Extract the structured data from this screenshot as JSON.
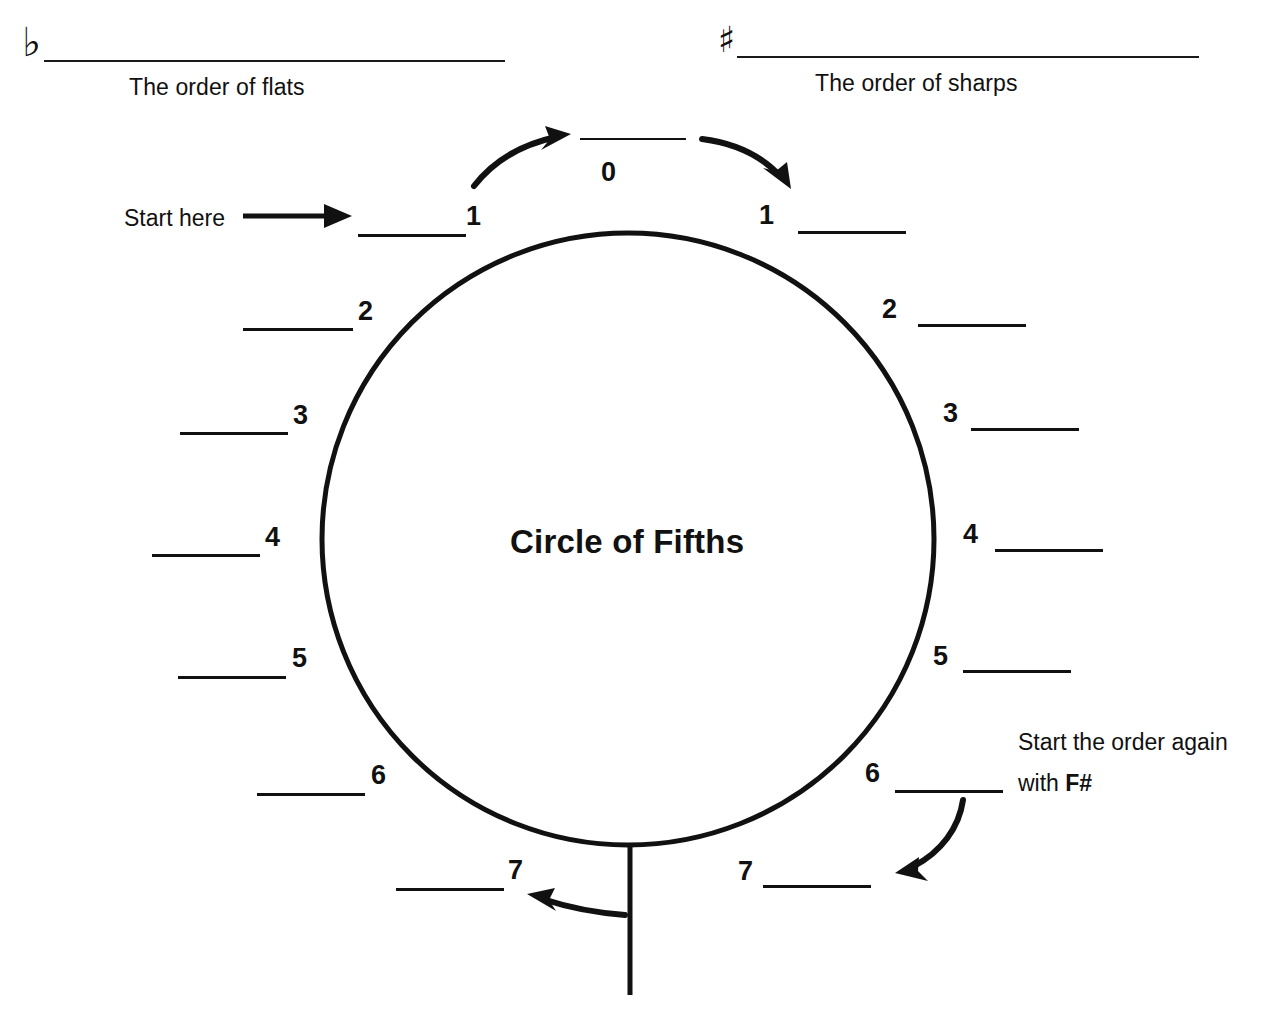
{
  "page": {
    "title": "Circle of Fifths",
    "background": "#ffffff",
    "ink_color": "#111111"
  },
  "header": {
    "flats": {
      "symbol": "♭",
      "symbol_name": "flat-sign",
      "caption": "The order of flats",
      "answer_value": ""
    },
    "sharps": {
      "symbol": "♯",
      "symbol_name": "sharp-sign",
      "caption": "The order of sharps",
      "answer_value": ""
    }
  },
  "circle": {
    "center_label": "Circle of Fifths"
  },
  "annotations": {
    "start_here": "Start here",
    "restart_line1": "Start the order again",
    "restart_line2_prefix": "with ",
    "restart_line2_bold": "F#"
  },
  "top_slot": {
    "number": "0",
    "value": ""
  },
  "flat_slots": [
    {
      "number": "1",
      "value": ""
    },
    {
      "number": "2",
      "value": ""
    },
    {
      "number": "3",
      "value": ""
    },
    {
      "number": "4",
      "value": ""
    },
    {
      "number": "5",
      "value": ""
    },
    {
      "number": "6",
      "value": ""
    },
    {
      "number": "7",
      "value": ""
    }
  ],
  "sharp_slots": [
    {
      "number": "1",
      "value": ""
    },
    {
      "number": "2",
      "value": ""
    },
    {
      "number": "3",
      "value": ""
    },
    {
      "number": "4",
      "value": ""
    },
    {
      "number": "5",
      "value": ""
    },
    {
      "number": "6",
      "value": ""
    },
    {
      "number": "7",
      "value": ""
    }
  ]
}
